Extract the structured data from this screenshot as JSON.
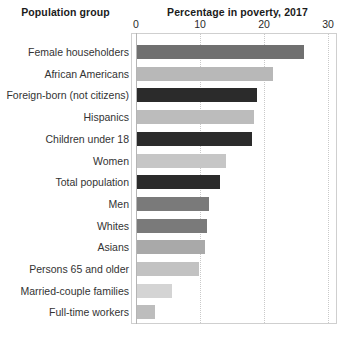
{
  "headers": {
    "left": "Population group",
    "right": "Percentage in poverty, 2017"
  },
  "chart_data": {
    "type": "bar",
    "orientation": "horizontal",
    "title": "Percentage in poverty, 2017",
    "xlabel": "",
    "ylabel": "Population group",
    "xlim": [
      0,
      30
    ],
    "xticks": [
      0,
      10,
      20,
      30
    ],
    "xtick_labels": [
      "0",
      "10",
      "20",
      "30"
    ],
    "grid": "vertical-dotted",
    "legend": "none",
    "categories": [
      "Female householders",
      "African Americans",
      "Foreign-born (not citizens)",
      "Hispanics",
      "Children under 18",
      "Women",
      "Total population",
      "Men",
      "Whites",
      "Asians",
      "Persons 65 and older",
      "Married-couple families",
      "Full-time workers"
    ],
    "values": [
      26.1,
      21.2,
      18.8,
      18.3,
      17.9,
      13.9,
      12.9,
      11.2,
      11.0,
      10.6,
      9.7,
      5.5,
      2.8
    ],
    "bar_colors": [
      "#707070",
      "#b8b8b8",
      "#2b2b2b",
      "#bcbcbc",
      "#2b2b2b",
      "#c6c6c6",
      "#2b2b2b",
      "#7a7a7a",
      "#7a7a7a",
      "#a9a9a9",
      "#c2c2c2",
      "#d4d4d4",
      "#bdbdbd"
    ]
  }
}
